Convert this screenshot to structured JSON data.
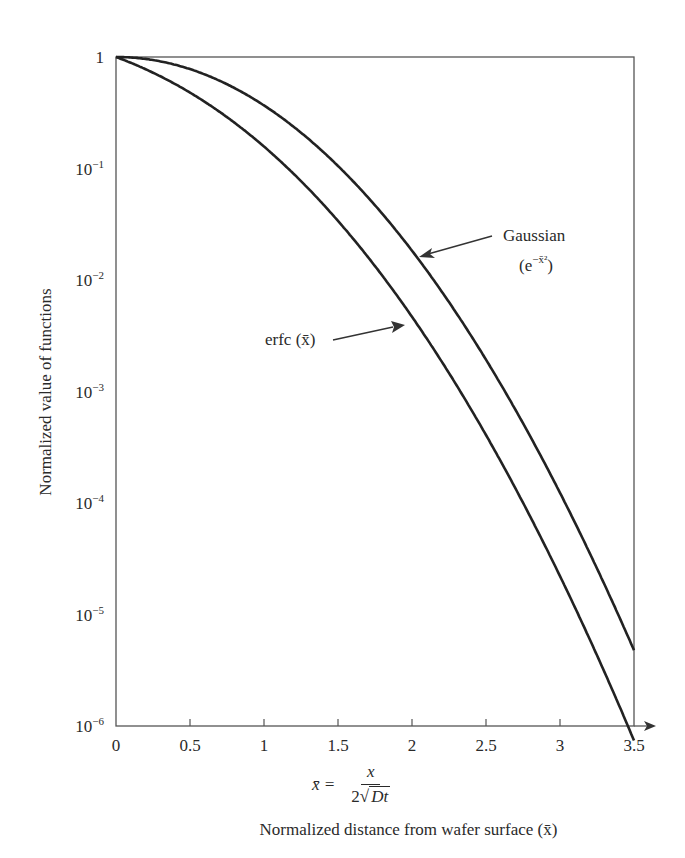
{
  "chart_data": {
    "type": "line",
    "title": "",
    "xlabel": "Normalized distance from wafer surface (x̄)",
    "xlabel_formula": {
      "lhs": "x̄ =",
      "numerator": "x",
      "denominator_coef": "2",
      "denominator_sqrt": "Dt"
    },
    "ylabel": "Normalized value of functions",
    "xlim": [
      0,
      3.5
    ],
    "ylim": [
      1e-06,
      1
    ],
    "yscale": "log",
    "grid": false,
    "x_ticks": [
      "0",
      "0.5",
      "1",
      "1.5",
      "2",
      "2.5",
      "3",
      "3.5"
    ],
    "x_tick_values": [
      0,
      0.5,
      1,
      1.5,
      2,
      2.5,
      3,
      3.5
    ],
    "y_ticks": [
      {
        "base": "1",
        "exp": ""
      },
      {
        "base": "10",
        "exp": "−1"
      },
      {
        "base": "10",
        "exp": "−2"
      },
      {
        "base": "10",
        "exp": "−3"
      },
      {
        "base": "10",
        "exp": "−4"
      },
      {
        "base": "10",
        "exp": "−5"
      },
      {
        "base": "10",
        "exp": "−6"
      }
    ],
    "series": [
      {
        "name": "Gaussian (e^(−x̄²))",
        "function": "exp(-x^2)",
        "x": [
          0,
          0.5,
          1,
          1.5,
          2,
          2.5,
          3,
          3.5
        ],
        "values": [
          1,
          0.7788,
          0.3679,
          0.1054,
          0.0183,
          0.00193,
          0.000123,
          4.8e-06
        ]
      },
      {
        "name": "erfc (x̄)",
        "function": "erfc(x)",
        "x": [
          0,
          0.5,
          1,
          1.5,
          2,
          2.5,
          3,
          3.5
        ],
        "values": [
          1,
          0.4795,
          0.1573,
          0.0339,
          0.00468,
          0.000407,
          2.21e-05,
          7.4e-07
        ]
      }
    ],
    "annotations": [
      {
        "text": "Gaussian",
        "sub": "(e",
        "sup": "−x̄²",
        "close": ")",
        "points_to_x": 2.05
      },
      {
        "text": "erfc (x̄)",
        "points_to_x": 1.97
      }
    ],
    "legend": "none (inline arrow annotations)"
  }
}
